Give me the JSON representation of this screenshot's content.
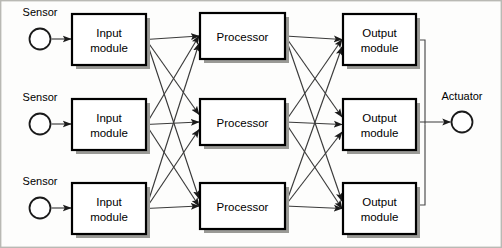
{
  "diagram": {
    "type": "block-diagram",
    "colors": {
      "box_fill": "#ffffff",
      "box_stroke": "#000000",
      "box_shadow": "#9a9a96",
      "line": "#3a3a3a",
      "text": "#000000",
      "background": "#fdfdfc",
      "frame": "#b9b9b4"
    },
    "columns": [
      {
        "id": "sensors",
        "label": "Sensor column"
      },
      {
        "id": "input_modules",
        "label": "Input module column"
      },
      {
        "id": "processors",
        "label": "Processor column"
      },
      {
        "id": "output_modules",
        "label": "Output module column"
      },
      {
        "id": "actuator",
        "label": "Actuator column"
      }
    ],
    "sensors": [
      {
        "id": "sensor-1",
        "label": "Sensor",
        "cx": 40,
        "cy": 39,
        "r": 10.5,
        "label_x": 40,
        "label_y": 16
      },
      {
        "id": "sensor-2",
        "label": "Sensor",
        "cx": 40,
        "cy": 124,
        "r": 10.5,
        "label_x": 40,
        "label_y": 101
      },
      {
        "id": "sensor-3",
        "label": "Sensor",
        "cx": 40,
        "cy": 208,
        "r": 10.5,
        "label_x": 40,
        "label_y": 185
      }
    ],
    "input_modules": [
      {
        "id": "input-module-1",
        "line1": "Input",
        "line2": "module",
        "x": 72,
        "y": 14,
        "w": 74,
        "h": 51
      },
      {
        "id": "input-module-2",
        "line1": "Input",
        "line2": "module",
        "x": 72,
        "y": 99,
        "w": 74,
        "h": 51
      },
      {
        "id": "input-module-3",
        "line1": "Input",
        "line2": "module",
        "x": 72,
        "y": 183,
        "w": 74,
        "h": 51
      }
    ],
    "processors": [
      {
        "id": "processor-1",
        "line1": "Processor",
        "line2": "",
        "x": 200,
        "y": 13,
        "w": 85,
        "h": 46
      },
      {
        "id": "processor-2",
        "line1": "Processor",
        "line2": "",
        "x": 200,
        "y": 99,
        "w": 85,
        "h": 46
      },
      {
        "id": "processor-3",
        "line1": "Processor",
        "line2": "",
        "x": 200,
        "y": 183,
        "w": 85,
        "h": 46
      }
    ],
    "output_modules": [
      {
        "id": "output-module-1",
        "line1": "Output",
        "line2": "module",
        "x": 343,
        "y": 14,
        "w": 73,
        "h": 51
      },
      {
        "id": "output-module-2",
        "line1": "Output",
        "line2": "module",
        "x": 343,
        "y": 99,
        "w": 73,
        "h": 51
      },
      {
        "id": "output-module-3",
        "line1": "Output",
        "line2": "module",
        "x": 343,
        "y": 183,
        "w": 73,
        "h": 51
      }
    ],
    "actuators": [
      {
        "id": "actuator-1",
        "label": "Actuator",
        "cx": 462,
        "cy": 122,
        "r": 10.5,
        "label_x": 462,
        "label_y": 100
      }
    ],
    "connections": {
      "sensor_to_input": [
        {
          "from": "sensor-1",
          "to": "input-module-1"
        },
        {
          "from": "sensor-2",
          "to": "input-module-2"
        },
        {
          "from": "sensor-3",
          "to": "input-module-3"
        }
      ],
      "input_to_processor": "full-mesh-3x3",
      "processor_to_output": "full-mesh-3x3",
      "output_to_actuator": [
        {
          "from": "output-module-1",
          "to": "actuator-1",
          "routing": "right-then-down"
        },
        {
          "from": "output-module-2",
          "to": "actuator-1",
          "routing": "straight"
        },
        {
          "from": "output-module-3",
          "to": "actuator-1",
          "routing": "right-then-up"
        }
      ]
    }
  }
}
